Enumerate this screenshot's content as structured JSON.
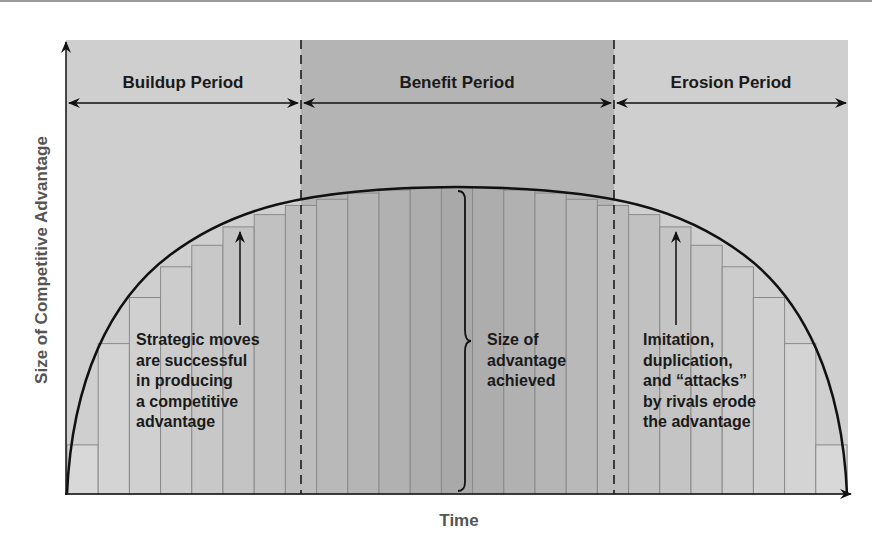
{
  "figure": {
    "y_axis_label": "Size of Competitive Advantage",
    "x_axis_label": "Time",
    "periods": [
      {
        "label": "Buildup Period"
      },
      {
        "label": "Benefit Period"
      },
      {
        "label": "Erosion Period"
      }
    ],
    "annotations": {
      "buildup_note": [
        "Strategic moves",
        "are successful",
        "in producing",
        "a competitive",
        "advantage"
      ],
      "benefit_note": [
        "Size of",
        "advantage",
        "achieved"
      ],
      "erosion_note": [
        "Imitation,",
        "duplication,",
        "and “attacks”",
        "by rivals erode",
        "the advantage"
      ]
    },
    "colors": {
      "outer_region": "#cfcfcf",
      "benefit_region": "#b4b4b4",
      "bar_light": "#d8d8d8",
      "bar_dark": "#a9a9a9",
      "line": "#111111"
    },
    "bars": {
      "count": 25,
      "relative_heights": [
        0.16,
        0.49,
        0.64,
        0.74,
        0.81,
        0.87,
        0.91,
        0.94,
        0.96,
        0.98,
        0.99,
        1.0,
        1.0,
        1.0,
        0.99,
        0.98,
        0.96,
        0.94,
        0.91,
        0.87,
        0.81,
        0.74,
        0.64,
        0.49,
        0.16
      ]
    }
  }
}
